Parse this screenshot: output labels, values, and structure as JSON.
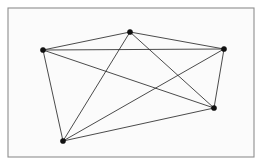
{
  "figure": {
    "canvas_width": 263,
    "canvas_height": 166,
    "background_color": "#ffffff"
  },
  "frame": {
    "name": "border-frame",
    "x": 8,
    "y": 8,
    "width": 246,
    "height": 149,
    "stroke_color": "#8e8e8e",
    "fill_color": "#fbfbfb",
    "stroke_width": 1.1
  },
  "chart_data": {
    "type": "scatter",
    "xlabel": "",
    "ylabel": "",
    "xlim": [
      0,
      263
    ],
    "ylim": [
      0,
      166
    ],
    "grid": false,
    "legend": false,
    "graph_name": "K5",
    "vertex_count": 5,
    "edge_count": 10,
    "vertex_degree": 4,
    "vertex_color": "#111111",
    "edge_color": "#2b2b2b",
    "vertex_radius": 2.6,
    "edge_width": 0.85,
    "nodes": [
      {
        "id": "v1",
        "label": "top-left",
        "x": 43,
        "y": 50
      },
      {
        "id": "v2",
        "label": "top",
        "x": 130,
        "y": 32
      },
      {
        "id": "v3",
        "label": "top-right",
        "x": 224,
        "y": 49
      },
      {
        "id": "v4",
        "label": "bottom-right",
        "x": 214,
        "y": 108
      },
      {
        "id": "v5",
        "label": "bottom-left",
        "x": 63,
        "y": 141
      }
    ],
    "edges": [
      {
        "id": "e1",
        "source": "v1",
        "target": "v2"
      },
      {
        "id": "e2",
        "source": "v1",
        "target": "v3"
      },
      {
        "id": "e3",
        "source": "v1",
        "target": "v4"
      },
      {
        "id": "e4",
        "source": "v1",
        "target": "v5"
      },
      {
        "id": "e5",
        "source": "v2",
        "target": "v3"
      },
      {
        "id": "e6",
        "source": "v2",
        "target": "v4"
      },
      {
        "id": "e7",
        "source": "v2",
        "target": "v5"
      },
      {
        "id": "e8",
        "source": "v3",
        "target": "v4"
      },
      {
        "id": "e9",
        "source": "v3",
        "target": "v5"
      },
      {
        "id": "e10",
        "source": "v4",
        "target": "v5"
      }
    ]
  }
}
